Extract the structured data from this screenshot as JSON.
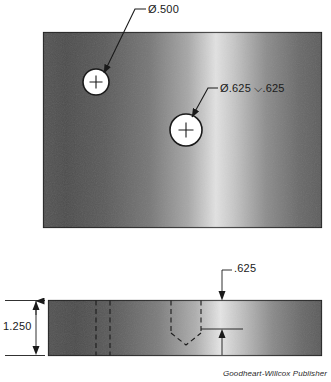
{
  "drawing": {
    "title": "Blind hole and through hole detail drawing",
    "credit": "Goodheart-Willcox Publisher",
    "views": [
      {
        "name": "top-view",
        "label": "Top View",
        "features": [
          {
            "name": "through-hole",
            "callout": "Ø.500",
            "center_mark": "+"
          },
          {
            "name": "blind-hole",
            "callout": "Ø.625 ⌵.625",
            "center_mark": "+"
          }
        ]
      },
      {
        "name": "section-view",
        "label": "Section View",
        "dimensions": [
          {
            "name": "thickness",
            "value": "1.250"
          },
          {
            "name": "hole-depth",
            "value": ".625"
          }
        ]
      }
    ],
    "callouts": {
      "hole_a": "Ø.500",
      "hole_b_diameter": "Ø.625",
      "hole_b_depth_symbol": "⌵",
      "hole_b_depth": ".625",
      "hole_b_full": "Ø.625 ⌵.625"
    },
    "dimensions": {
      "thickness": "1.250",
      "depth": ".625"
    },
    "colors": {
      "line": "#1a1a1a",
      "material_dark": "#4a4a4a",
      "material_light": "#d8d8d8",
      "hole_fill": "#ffffff",
      "background": "#ffffff"
    }
  }
}
